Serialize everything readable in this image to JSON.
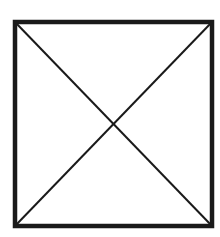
{
  "diagram": {
    "type": "square-with-diagonals",
    "square": {
      "x": 15,
      "y": 22,
      "width": 197,
      "height": 204,
      "stroke_color": "#1a1a1a",
      "stroke_width": 4.5
    },
    "diagonals": [
      {
        "name": "top-left-to-bottom-right",
        "x1": 15,
        "y1": 22,
        "x2": 212,
        "y2": 226
      },
      {
        "name": "top-right-to-bottom-left",
        "x1": 212,
        "y1": 22,
        "x2": 15,
        "y2": 226
      }
    ],
    "diagonal_color": "#1a1a1a",
    "diagonal_width": 2,
    "background": "#ffffff"
  }
}
